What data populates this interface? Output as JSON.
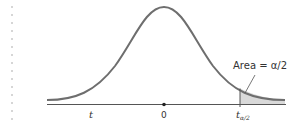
{
  "figure": {
    "type": "t-distribution density curve with shaded upper tail",
    "axis_labels": {
      "variable": "t",
      "center": "0",
      "critical_value_main": "t",
      "critical_value_subscript": "α/2"
    },
    "annotation": {
      "text": "Area = α/2"
    },
    "colors": {
      "curve": "#6e6e6e",
      "axis": "#555555",
      "shade": "#d9d9d9",
      "text": "#333333",
      "dot_border": "#c9c9c9"
    }
  }
}
